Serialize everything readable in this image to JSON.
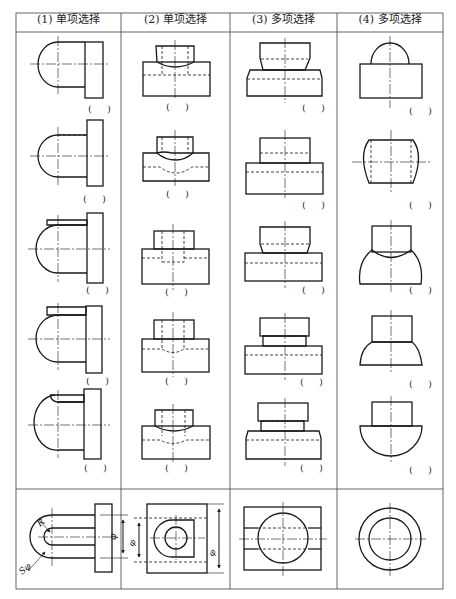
{
  "table": {
    "headers": [
      {
        "label": "(1) 单项选择"
      },
      {
        "label": "(2) 单项选择"
      },
      {
        "label": "(3) 多项选择"
      },
      {
        "label": "(4) 多项选择"
      }
    ],
    "answer_placeholder": "( )",
    "rows": 5,
    "columns": 4
  },
  "reference_row": {
    "col1": {
      "radius_label": "R",
      "sphere_label": "Sφ",
      "dim_label": "φ"
    },
    "col2": {
      "left_dim_label": "φ",
      "right_dim_label": "φ"
    },
    "col3": {},
    "col4": {}
  },
  "colors": {
    "line": "#1a1a1a",
    "grid": "#555555",
    "background": "#ffffff"
  }
}
